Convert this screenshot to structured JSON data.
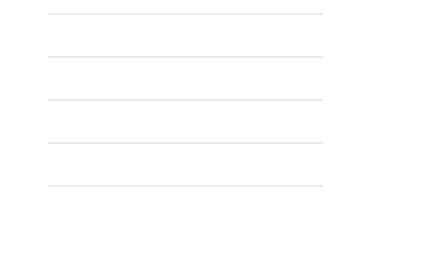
{
  "chart_data": {
    "type": "line",
    "title": "",
    "xlabel": "",
    "ylabel": "$ (2014, ppp)",
    "xlim": [
      1975,
      2014
    ],
    "ylim": [
      0,
      250
    ],
    "ytick_values": [
      0,
      50,
      100,
      150,
      200,
      250
    ],
    "ytick_labels": [
      "0",
      "50",
      "100",
      "150",
      "200",
      "250"
    ],
    "xtick_labels": [
      "1975",
      "1978",
      "1981",
      "1984",
      "1987",
      "1990",
      "1993",
      "1996",
      "1999",
      "2002",
      "2005",
      "2008",
      "2011",
      "2014"
    ],
    "xtick_values": [
      1975,
      1978,
      1981,
      1984,
      1987,
      1990,
      1993,
      1996,
      1999,
      2002,
      2005,
      2008,
      2011,
      2014
    ],
    "grid": true,
    "legend_position": "right",
    "x": [
      1975,
      1976,
      1977,
      1978,
      1979,
      1980,
      1981,
      1982,
      1983,
      1984,
      1985,
      1986,
      1987,
      1988,
      1989,
      1990,
      1991,
      1992,
      1993,
      1994,
      1995,
      1996,
      1997,
      1998,
      1999,
      2000,
      2001,
      2002,
      2003,
      2004,
      2005,
      2006,
      2007,
      2008,
      2009,
      2010,
      2011,
      2012,
      2013,
      2014
    ],
    "series": [
      {
        "name": "Denmark",
        "style": "solid",
        "marker": "none",
        "color": "#1a1a1a",
        "values": [
          1,
          3,
          5,
          7,
          8,
          10,
          11,
          9,
          7,
          6,
          5,
          8,
          6,
          5,
          6,
          8,
          10,
          12,
          12,
          11,
          10,
          10,
          10,
          9,
          9,
          9,
          10,
          10,
          9,
          10,
          11,
          9,
          6,
          5,
          18,
          28,
          14,
          32,
          22,
          25
        ]
      },
      {
        "name": "Germany",
        "style": "solid",
        "marker": "x",
        "color": "#3a3a3a",
        "values": [
          1,
          4,
          7,
          11,
          20,
          28,
          48,
          50,
          38,
          27,
          19,
          16,
          11,
          10,
          21,
          20,
          25,
          19,
          30,
          40,
          65,
          50,
          41,
          43,
          37,
          38,
          32,
          22,
          23,
          17,
          22,
          21,
          17,
          26,
          38,
          46,
          43,
          51,
          60,
          65
        ]
      },
      {
        "name": "United States",
        "style": "dashdot",
        "marker": "none",
        "color": "#5a5a5a",
        "values": [
          3,
          12,
          30,
          55,
          95,
          146,
          175,
          155,
          90,
          62,
          50,
          42,
          25,
          18,
          28,
          30,
          24,
          20,
          29,
          62,
          95,
          72,
          63,
          60,
          56,
          58,
          57,
          54,
          54,
          56,
          60,
          63,
          100,
          200,
          120,
          100,
          97,
          75,
          83,
          75
        ]
      }
    ]
  }
}
